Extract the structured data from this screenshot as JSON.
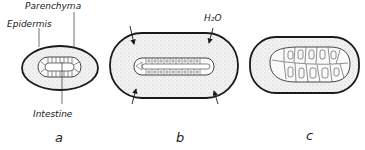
{
  "figure": {
    "panels": [
      {
        "id": "a",
        "label": "a",
        "annotations": {
          "parenchyma": "Parenchyma",
          "epidermis": "Epidermis",
          "intestine": "Intestine"
        }
      },
      {
        "id": "b",
        "label": "b",
        "annotations": {
          "water": "H₂O"
        },
        "arrows": 4
      },
      {
        "id": "c",
        "label": "c"
      }
    ],
    "colors": {
      "stroke": "#1a1a1a",
      "fill": "#e9e9e9",
      "dots": "#9a9a9a",
      "background": "#ffffff"
    }
  }
}
